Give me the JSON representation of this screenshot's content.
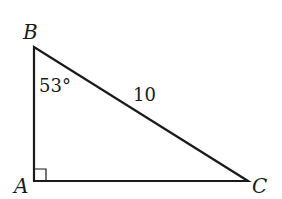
{
  "diagram": {
    "type": "right-triangle",
    "vertices": {
      "A": {
        "label": "A",
        "x": 34,
        "y": 181
      },
      "B": {
        "label": "B",
        "x": 34,
        "y": 47
      },
      "C": {
        "label": "C",
        "x": 248,
        "y": 181
      }
    },
    "angle_B": "53°",
    "hypotenuse_label": "10",
    "right_angle_at": "A",
    "stroke_color": "#1a1a1a"
  }
}
